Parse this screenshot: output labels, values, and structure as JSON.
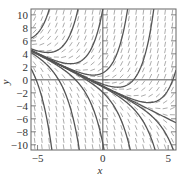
{
  "chart_data": {
    "type": "line",
    "subtype": "slope-field",
    "title": "",
    "equation": "dy/dx = x + y",
    "general_solution": "y = C*e^x - x - 1",
    "xlabel": "x",
    "ylabel": "y",
    "xlim": [
      -5.5,
      5.6
    ],
    "ylim": [
      -10.8,
      10.9
    ],
    "x_ticks": [
      -5,
      0,
      5
    ],
    "x_tick_labels": [
      "−5",
      "0",
      "5"
    ],
    "y_ticks": [
      10,
      8,
      6,
      4,
      2,
      0,
      -2,
      -4,
      -6,
      -8,
      -10
    ],
    "y_tick_labels": [
      "10",
      "8",
      "6",
      "4",
      "2",
      "0",
      "−2",
      "−4",
      "−6",
      "−8",
      "−10"
    ],
    "grid": false,
    "axes_lines_through_origin": true,
    "slope_field": {
      "nx": 20,
      "ny": 22,
      "segment_length": 5
    },
    "solution_curves_C": [
      470,
      67,
      11.9,
      2.07,
      0.32,
      0.03,
      0,
      -0.02,
      -0.106,
      -0.94,
      -8.8,
      -70,
      -677
    ],
    "colors": {
      "curve": "#555555",
      "field": "#888888",
      "frame": "#666666",
      "axis": "#555555"
    }
  },
  "labels": {
    "xlabel": "x",
    "ylabel": "y"
  }
}
